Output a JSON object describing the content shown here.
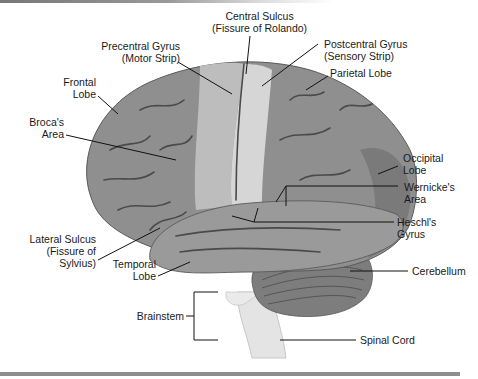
{
  "figure": {
    "type": "brain-lateral-view",
    "colors": {
      "cortex": "#8f8f8f",
      "cortex_dark": "#6f6f6f",
      "motor_strip": "#bdbdbd",
      "sensory_strip": "#d6d6d6",
      "sulci": "#4a4a4a",
      "temporal": "#9a9a9a",
      "cerebellum": "#7d7d7d",
      "brainstem": "#e4e4e4",
      "leader_line": "#111111",
      "bottom_rule": "#8e8e8e"
    }
  },
  "labels": {
    "central_sulcus": {
      "line1": "Central Sulcus",
      "line2": "(Fissure of Rolando)"
    },
    "precentral_gyrus": {
      "line1": "Precentral Gyrus",
      "line2": "(Motor Strip)"
    },
    "postcentral_gyrus": {
      "line1": "Postcentral Gyrus",
      "line2": "(Sensory Strip)"
    },
    "frontal_lobe": {
      "line1": "Frontal",
      "line2": "Lobe"
    },
    "parietal_lobe": {
      "line1": "Parietal Lobe"
    },
    "brocas_area": {
      "line1": "Broca's",
      "line2": "Area"
    },
    "occipital_lobe": {
      "line1": "Occipital",
      "line2": "Lobe"
    },
    "wernickes_area": {
      "line1": "Wernicke's",
      "line2": "Area"
    },
    "heschls_gyrus": {
      "line1": "Heschl's",
      "line2": "Gyrus"
    },
    "lateral_sulcus": {
      "line1": "Lateral Sulcus",
      "line2": "(Fissure of",
      "line3": "Sylvius)"
    },
    "temporal_lobe": {
      "line1": "Temporal",
      "line2": "Lobe"
    },
    "cerebellum": {
      "line1": "Cerebellum"
    },
    "brainstem": {
      "line1": "Brainstem"
    },
    "spinal_cord": {
      "line1": "Spinal Cord"
    }
  }
}
